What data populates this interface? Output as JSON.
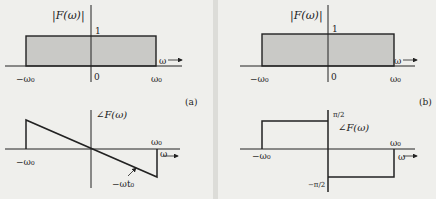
{
  "figure": {
    "panel_a": {
      "tag": "(a)",
      "magnitude": {
        "ylabel": "|F(ω)|",
        "level_label": "1",
        "origin_label": "0",
        "x_axis_label": "ω",
        "left_label": "−ω₀",
        "right_label": "ω₀"
      },
      "phase": {
        "ylabel": "∠F(ω)",
        "left_label": "−ω₀",
        "right_label": "ω₀",
        "x_axis_label": "ω",
        "slope_label": "−ωt₀"
      }
    },
    "panel_b": {
      "tag": "(b)",
      "magnitude": {
        "ylabel": "|F(ω)|",
        "level_label": "1",
        "origin_label": "0",
        "x_axis_label": "ω",
        "left_label": "−ω₀",
        "right_label": "ω₀"
      },
      "phase": {
        "ylabel": "∠F(ω)",
        "top_label": "π/2",
        "bottom_label": "−π/2",
        "left_label": "−ω₀",
        "right_label": "ω₀",
        "x_axis_label": "ω"
      }
    },
    "colors": {
      "line": "#222222",
      "fill": "#c9c9c6",
      "background": "#efefec"
    }
  }
}
